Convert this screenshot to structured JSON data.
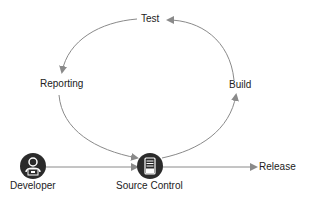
{
  "diagram": {
    "type": "devops-cycle",
    "nodes": {
      "test": {
        "label": "Test"
      },
      "build": {
        "label": "Build"
      },
      "reporting": {
        "label": "Reporting"
      },
      "developer": {
        "label": "Developer",
        "icon": "developer-laptop-icon"
      },
      "source_control": {
        "label": "Source Control",
        "icon": "server-icon"
      },
      "release": {
        "label": "Release"
      }
    },
    "edges": [
      {
        "from": "Developer",
        "to": "Source Control"
      },
      {
        "from": "Source Control",
        "to": "Build"
      },
      {
        "from": "Build",
        "to": "Test"
      },
      {
        "from": "Test",
        "to": "Reporting"
      },
      {
        "from": "Reporting",
        "to": "Source Control"
      },
      {
        "from": "Source Control",
        "to": "Release"
      }
    ],
    "colors": {
      "arrow": "#8a8a8a",
      "icon": "#2b2b2b",
      "text": "#222222"
    }
  }
}
